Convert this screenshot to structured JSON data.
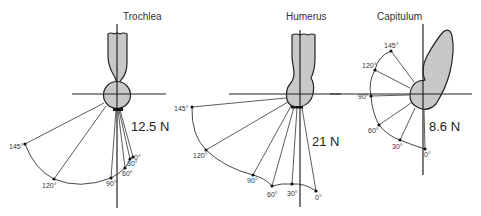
{
  "panels": [
    {
      "id": "trochlea",
      "title": "Trochlea",
      "force_label": "12.5 N",
      "angles": [
        {
          "label": "0°",
          "x": 133,
          "y": 157
        },
        {
          "label": "30°",
          "x": 130,
          "y": 159
        },
        {
          "label": "60°",
          "x": 125,
          "y": 168
        },
        {
          "label": "90°",
          "x": 111,
          "y": 178
        },
        {
          "label": "120°",
          "x": 54,
          "y": 179
        },
        {
          "label": "145°",
          "x": 25,
          "y": 144
        }
      ],
      "center": {
        "x": 117,
        "y": 95
      }
    },
    {
      "id": "humerus",
      "title": "Humerus",
      "force_label": "21 N",
      "angles": [
        {
          "label": "0°",
          "x": 316,
          "y": 191
        },
        {
          "label": "30°",
          "x": 292,
          "y": 184
        },
        {
          "label": "60°",
          "x": 272,
          "y": 186
        },
        {
          "label": "90°",
          "x": 253,
          "y": 175
        },
        {
          "label": "120°",
          "x": 206,
          "y": 150
        },
        {
          "label": "145°",
          "x": 192,
          "y": 107
        }
      ],
      "center": {
        "x": 300,
        "y": 95
      }
    },
    {
      "id": "capitulum",
      "title": "Capitulum",
      "force_label": "8.6 N",
      "angles": [
        {
          "label": "0°",
          "x": 425,
          "y": 149
        },
        {
          "label": "30°",
          "x": 400,
          "y": 140
        },
        {
          "label": "60°",
          "x": 379,
          "y": 125
        },
        {
          "label": "90°",
          "x": 371,
          "y": 96
        },
        {
          "label": "120°",
          "x": 375,
          "y": 70
        },
        {
          "label": "145°",
          "x": 391,
          "y": 51
        }
      ],
      "center": {
        "x": 423,
        "y": 95
      }
    }
  ],
  "colors": {
    "bone_fill": "#c8c8c8",
    "line": "#222222",
    "background": "#ffffff"
  }
}
